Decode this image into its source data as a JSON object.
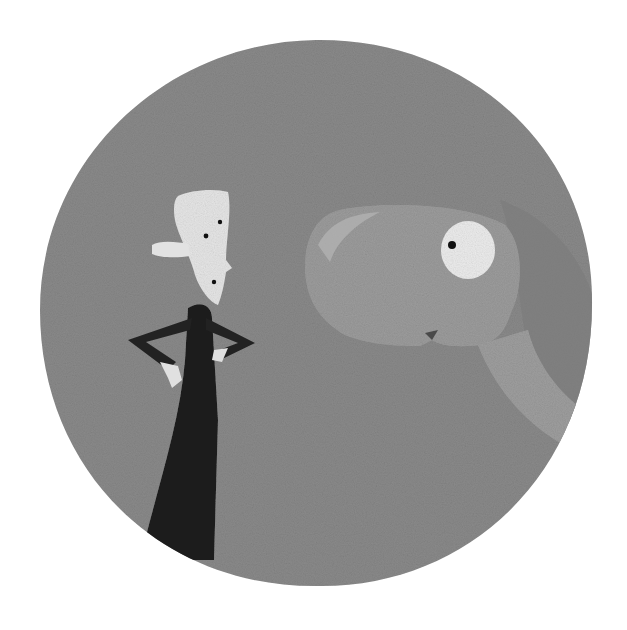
{
  "image": {
    "description": "Grayscale painted illustration inside a round textured gray disc: a small stick-like man with a pale blocky head and dark tapered body, hands on hips, facing a large round-headed long-necked creature with a big white eye.",
    "palette": {
      "background": "#ffffff",
      "disc": "#8a8a8a",
      "disc_shadow": "#7a7a7a",
      "creature": "#9c9c9c",
      "creature_highlight": "#b0b0b0",
      "eye_white": "#efefef",
      "pupil": "#111111",
      "man_body": "#1e1e1e",
      "man_head": "#e6e6e6",
      "hands": "#e0e0e0"
    }
  }
}
